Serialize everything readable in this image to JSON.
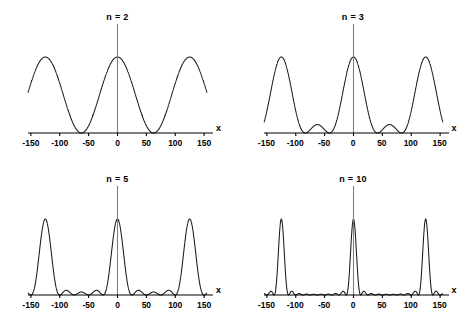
{
  "figure": {
    "background_color": "#ffffff",
    "curve_color": "#1a1a1a",
    "axis_color": "#000000",
    "marker_line_color": "#808080",
    "panel_count": 4
  },
  "axis": {
    "xlabel": "x",
    "tick_values": [
      -150,
      -100,
      -50,
      0,
      50,
      100,
      150
    ],
    "tick_labels": [
      "-150",
      "-100",
      "-50",
      "0",
      "50",
      "100",
      "150"
    ],
    "xlim": [
      -155,
      155
    ],
    "ylim": [
      0,
      1
    ],
    "grid": false
  },
  "panels": [
    {
      "id": "panel-n2",
      "label": "n = 2",
      "n_slits": 2,
      "marker_x": 0
    },
    {
      "id": "panel-n3",
      "label": "n = 3",
      "n_slits": 3,
      "marker_x": 0
    },
    {
      "id": "panel-n5",
      "label": "n = 5",
      "n_slits": 5,
      "marker_x": 0
    },
    {
      "id": "panel-n10",
      "label": "n = 10",
      "n_slits": 10,
      "marker_x": 0
    }
  ],
  "chart_data": [
    {
      "type": "line",
      "title": "n = 2",
      "xlabel": "x",
      "ylabel": "",
      "xlim": [
        -155,
        155
      ],
      "ylim": [
        0,
        1
      ],
      "xticks": [
        -150,
        -100,
        -50,
        0,
        50,
        100,
        150
      ],
      "grid": false,
      "series": [
        {
          "name": "n = 2",
          "formula": "I(x) = [sin(n*pi*x/d) / (n*sin(pi*x/d))]^2, n=2, d=125",
          "n_slits": 2,
          "period": 125,
          "principal_maxima_x": [
            -125,
            0,
            125
          ],
          "principal_maxima_y": [
            1,
            1,
            1
          ],
          "secondary_maxima_x": [],
          "secondary_maxima_y": [],
          "extra_maxima_x": [
            -156.25,
            -93.75,
            -62.5,
            -31.25,
            31.25,
            62.5,
            93.75,
            156.25
          ],
          "note": "cos-squared fringes, all maxima equal height, period 62.5 between adjacent maxima",
          "zeros_x": [
            -140.6,
            -109.4,
            -78.1,
            -46.9,
            -15.6,
            15.6,
            46.9,
            78.1,
            109.4,
            140.6
          ]
        }
      ]
    },
    {
      "type": "line",
      "title": "n = 3",
      "xlabel": "x",
      "ylabel": "",
      "xlim": [
        -155,
        155
      ],
      "ylim": [
        0,
        1
      ],
      "xticks": [
        -150,
        -100,
        -50,
        0,
        50,
        100,
        150
      ],
      "grid": false,
      "series": [
        {
          "name": "n = 3",
          "formula": "I(x) = [sin(n*pi*x/d) / (n*sin(pi*x/d))]^2, n=3, d=125",
          "n_slits": 3,
          "period": 125,
          "principal_maxima_x": [
            -125,
            -62.5,
            0,
            62.5,
            125
          ],
          "principal_maxima_y": [
            1,
            1,
            1,
            1,
            1
          ],
          "secondary_maxima_x": [
            -93.75,
            -31.25,
            31.25,
            93.75
          ],
          "secondary_maxima_y": [
            0.111,
            0.111,
            0.111,
            0.111
          ],
          "note": "1 secondary maximum between principal maxima, height 1/9"
        }
      ]
    },
    {
      "type": "line",
      "title": "n = 5",
      "xlabel": "x",
      "ylabel": "",
      "xlim": [
        -155,
        155
      ],
      "ylim": [
        0,
        1
      ],
      "xticks": [
        -150,
        -100,
        -50,
        0,
        50,
        100,
        150
      ],
      "grid": false,
      "series": [
        {
          "name": "n = 5",
          "formula": "I(x) = [sin(n*pi*x/d) / (n*sin(pi*x/d))]^2, n=5, d=125",
          "n_slits": 5,
          "period": 125,
          "principal_maxima_x": [
            -125,
            0,
            125
          ],
          "principal_maxima_y": [
            1,
            1,
            1
          ],
          "secondary_maxima_x": [
            -93.75,
            -62.5,
            -31.25,
            31.25,
            62.5,
            93.75
          ],
          "secondary_maxima_y": [
            0.045,
            0.016,
            0.045,
            0.045,
            0.016,
            0.045
          ],
          "note": "3 secondary maxima between principal maxima, max height ~1/22"
        }
      ]
    },
    {
      "type": "line",
      "title": "n = 10",
      "xlabel": "x",
      "ylabel": "",
      "xlim": [
        -155,
        155
      ],
      "ylim": [
        0,
        1
      ],
      "xticks": [
        -150,
        -100,
        -50,
        0,
        50,
        100,
        150
      ],
      "grid": false,
      "series": [
        {
          "name": "n = 10",
          "formula": "I(x) = [sin(n*pi*x/d) / (n*sin(pi*x/d))]^2, n=10, d=125",
          "n_slits": 10,
          "period": 125,
          "principal_maxima_x": [
            0
          ],
          "principal_maxima_y": [
            1
          ],
          "secondary_maxima_x": [
            -43.75,
            -31.25,
            -18.75,
            18.75,
            31.25,
            43.75
          ],
          "secondary_maxima_y": [
            0.008,
            0.017,
            0.047,
            0.047,
            0.017,
            0.008
          ],
          "note": "8 tiny secondary maxima between principal maxima, very narrow central peak"
        }
      ]
    }
  ]
}
